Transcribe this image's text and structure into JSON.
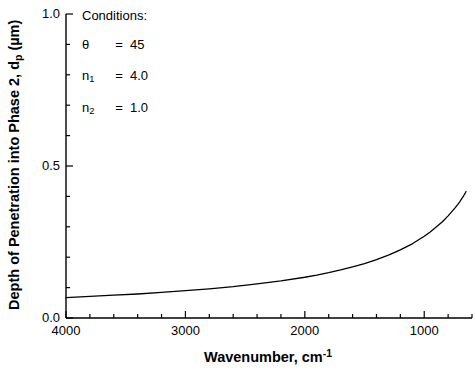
{
  "chart_data": {
    "type": "line",
    "title": "",
    "xlabel": "Wavenumber, cm-1",
    "xlabel_base": "Wavenumber, cm",
    "xlabel_exp": "-1",
    "ylabel": "Depth of Penetration into Phase 2, dp (µm)",
    "ylabel_part1": "Depth of Penetration into Phase 2, d",
    "ylabel_sub": "p",
    "ylabel_part2": " (µm)",
    "xlim": [
      4000,
      600
    ],
    "ylim": [
      0.0,
      1.0
    ],
    "x_major_ticks": [
      4000,
      3000,
      2000,
      1000
    ],
    "x_major_tick_labels": [
      "4000",
      "3000",
      "2000",
      "1000"
    ],
    "x_minor_tick_step": 200,
    "y_major_ticks": [
      0.0,
      0.5,
      1.0
    ],
    "y_major_tick_labels": [
      "0.0",
      "0.5",
      "1.0"
    ],
    "y_minor_tick_step": 0.1,
    "grid": false,
    "legend": "none",
    "line_color": "#000000",
    "axis_color": "#000000",
    "series": [
      {
        "name": "Depth of penetration",
        "x": [
          4000,
          3800,
          3600,
          3400,
          3200,
          3000,
          2800,
          2600,
          2400,
          2200,
          2000,
          1900,
          1800,
          1700,
          1600,
          1500,
          1400,
          1300,
          1200,
          1100,
          1000,
          950,
          900,
          850,
          800,
          780,
          760,
          740,
          720,
          700,
          690,
          680,
          670,
          660,
          655,
          650
        ],
        "y": [
          0.067,
          0.071,
          0.075,
          0.079,
          0.084,
          0.09,
          0.096,
          0.103,
          0.112,
          0.122,
          0.134,
          0.141,
          0.149,
          0.158,
          0.168,
          0.179,
          0.192,
          0.207,
          0.224,
          0.244,
          0.269,
          0.283,
          0.299,
          0.316,
          0.336,
          0.345,
          0.354,
          0.363,
          0.373,
          0.384,
          0.39,
          0.396,
          0.402,
          0.409,
          0.412,
          0.416
        ]
      }
    ],
    "annotations": {
      "conditions_title": "Conditions:",
      "rows": [
        {
          "symbol": "θ",
          "sub": "",
          "equals": "=",
          "value": "45"
        },
        {
          "symbol": "n",
          "sub": "1",
          "equals": "=",
          "value": "4.0"
        },
        {
          "symbol": "n",
          "sub": "2",
          "equals": "=",
          "value": "1.0"
        }
      ]
    }
  }
}
